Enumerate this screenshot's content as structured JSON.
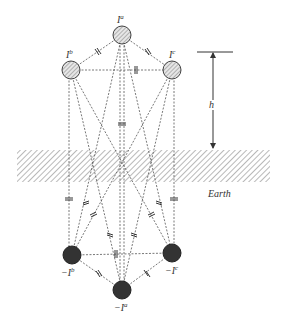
{
  "diagram": {
    "type": "method-of-images conductor diagram",
    "colors": {
      "line": "#555555",
      "conductor_fill": "#d9d9d9",
      "image_fill": "#333333",
      "earth_hatch": "#8a8a8a",
      "text": "#333333"
    },
    "conductors": [
      {
        "id": "a",
        "label_base": "I",
        "label_sup": "a",
        "cx": 122,
        "cy": 35,
        "r": 9
      },
      {
        "id": "b",
        "label_base": "I",
        "label_sup": "b",
        "cx": 71,
        "cy": 70,
        "r": 9
      },
      {
        "id": "c",
        "label_base": "I",
        "label_sup": "c",
        "cx": 172,
        "cy": 70,
        "r": 9
      }
    ],
    "images": [
      {
        "id": "a",
        "label_base": "−I",
        "label_sup": "a",
        "cx": 122,
        "cy": 290,
        "r": 9
      },
      {
        "id": "b",
        "label_base": "−I",
        "label_sup": "b",
        "cx": 72,
        "cy": 255,
        "r": 9
      },
      {
        "id": "c",
        "label_base": "−I",
        "label_sup": "c",
        "cx": 172,
        "cy": 253,
        "r": 9
      }
    ],
    "height_label": "h",
    "earth_label": "Earth"
  }
}
